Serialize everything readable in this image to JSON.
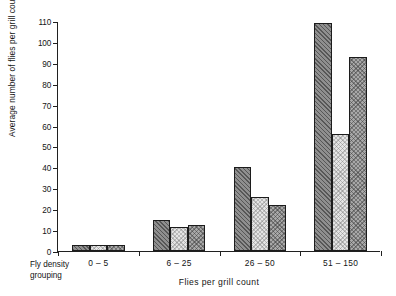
{
  "chart_data": {
    "type": "bar",
    "title": "",
    "subtitle": "",
    "xlabel": "Flies per grill count",
    "ylabel": "Average number of flies per grill count",
    "corner_label_line1": "Fly density",
    "corner_label_line2": "grouping",
    "categories": [
      "0 – 5",
      "6 – 25",
      "26 – 50",
      "51 – 150"
    ],
    "ylim": [
      0,
      110
    ],
    "yticks": [
      0,
      10,
      20,
      30,
      40,
      50,
      60,
      70,
      80,
      90,
      100,
      110
    ],
    "ytick_labels": [
      "0",
      "10",
      "20",
      "30",
      "40",
      "50",
      "60",
      "70",
      "80",
      "90",
      "100",
      "110"
    ],
    "grid": false,
    "legend": "none",
    "series": [
      {
        "name": "series-1",
        "pattern": "dark-diagonal-hatch",
        "color": "#8f8f8f",
        "values": [
          3,
          15,
          40,
          109
        ]
      },
      {
        "name": "series-2",
        "pattern": "light-stipple",
        "color": "#e4e4e4",
        "values": [
          3,
          11.5,
          26,
          56
        ]
      },
      {
        "name": "series-3",
        "pattern": "medium-cross-hatch",
        "color": "#a8a8a8",
        "values": [
          3,
          12.5,
          22,
          93
        ]
      }
    ]
  }
}
